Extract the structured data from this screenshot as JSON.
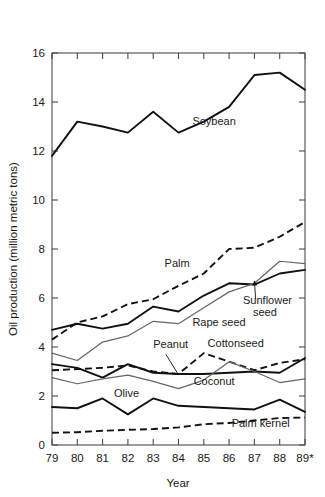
{
  "chart_data": {
    "type": "line",
    "title": "",
    "xlabel": "Year",
    "ylabel": "Oil production (million metric tons)",
    "x": [
      "79",
      "80",
      "81",
      "82",
      "83",
      "84",
      "85",
      "86",
      "87",
      "88",
      "89*"
    ],
    "xtick_labels": [
      "79",
      "80",
      "81",
      "82",
      "83",
      "84",
      "85",
      "86",
      "87",
      "88",
      "89*"
    ],
    "ytick_labels": [
      "0",
      "2",
      "4",
      "6",
      "8",
      "10",
      "12",
      "14",
      "16"
    ],
    "ytick_values": [
      0,
      2,
      4,
      6,
      8,
      10,
      12,
      14,
      16
    ],
    "ylim": [
      0,
      16
    ],
    "xlim": [
      0,
      10
    ],
    "grid": false,
    "legend_position": "inline-annotations",
    "series": [
      {
        "name": "Soybean",
        "style": "solid-thick",
        "color": "#111111",
        "values": [
          11.8,
          13.2,
          13.0,
          12.75,
          13.6,
          12.75,
          13.2,
          13.8,
          15.1,
          15.2,
          14.5
        ],
        "label_x": 5.55,
        "label_y": 13.05
      },
      {
        "name": "Palm",
        "style": "dashed-thick",
        "color": "#111111",
        "values": [
          4.3,
          5.0,
          5.25,
          5.75,
          5.95,
          6.5,
          7.0,
          8.0,
          8.05,
          8.5,
          9.1
        ],
        "label_x": 4.45,
        "label_y": 7.25
      },
      {
        "name": "Sunflower seed",
        "style": "solid-thick",
        "color": "#111111",
        "values": [
          4.7,
          4.95,
          4.75,
          4.95,
          5.65,
          5.45,
          6.1,
          6.6,
          6.55,
          7.0,
          7.15
        ],
        "label_x": 7.55,
        "label_y": 5.75
      },
      {
        "name": "Rape seed",
        "style": "solid-thin",
        "color": "#666666",
        "values": [
          3.75,
          3.45,
          4.2,
          4.45,
          5.05,
          4.95,
          5.6,
          6.25,
          6.6,
          7.5,
          7.4
        ],
        "label_x": 5.55,
        "label_y": 4.85
      },
      {
        "name": "Cottonseed",
        "style": "dashed-thick",
        "color": "#111111",
        "values": [
          3.05,
          3.1,
          3.15,
          3.25,
          3.0,
          2.9,
          3.75,
          3.4,
          3.05,
          3.35,
          3.5
        ],
        "label_x": 6.15,
        "label_y": 4.0
      },
      {
        "name": "Peanut",
        "style": "solid-thick",
        "color": "#111111",
        "values": [
          3.3,
          3.15,
          2.75,
          3.3,
          2.95,
          2.9,
          2.9,
          2.95,
          3.0,
          2.95,
          3.55
        ],
        "label_x": 4.0,
        "label_y": 3.95
      },
      {
        "name": "Coconut",
        "style": "solid-thin",
        "color": "#666666",
        "values": [
          2.75,
          2.5,
          2.7,
          2.85,
          2.6,
          2.3,
          2.65,
          3.4,
          3.0,
          2.55,
          2.7
        ],
        "label_x": 5.6,
        "label_y": 2.45
      },
      {
        "name": "Olive",
        "style": "solid-thick",
        "color": "#111111",
        "values": [
          1.55,
          1.5,
          1.9,
          1.25,
          1.9,
          1.6,
          1.55,
          1.5,
          1.45,
          1.85,
          1.35
        ],
        "label_x": 2.45,
        "label_y": 1.95
      },
      {
        "name": "Palm kernel",
        "style": "dashed-thick",
        "color": "#111111",
        "values": [
          0.5,
          0.52,
          0.58,
          0.62,
          0.65,
          0.72,
          0.85,
          0.9,
          1.0,
          1.1,
          1.12
        ],
        "label_x": 7.1,
        "label_y": 0.72
      }
    ],
    "annotations": [
      {
        "text": "Peanut",
        "type": "leader-line",
        "from_x": 4.5,
        "from_y": 3.7,
        "to_x": 4.95,
        "to_y": 2.95
      },
      {
        "text": "Sunflower seed",
        "type": "leader-arrow",
        "from_x": 8.05,
        "from_y": 5.95,
        "to_x": 8.0,
        "to_y": 6.7
      }
    ]
  }
}
